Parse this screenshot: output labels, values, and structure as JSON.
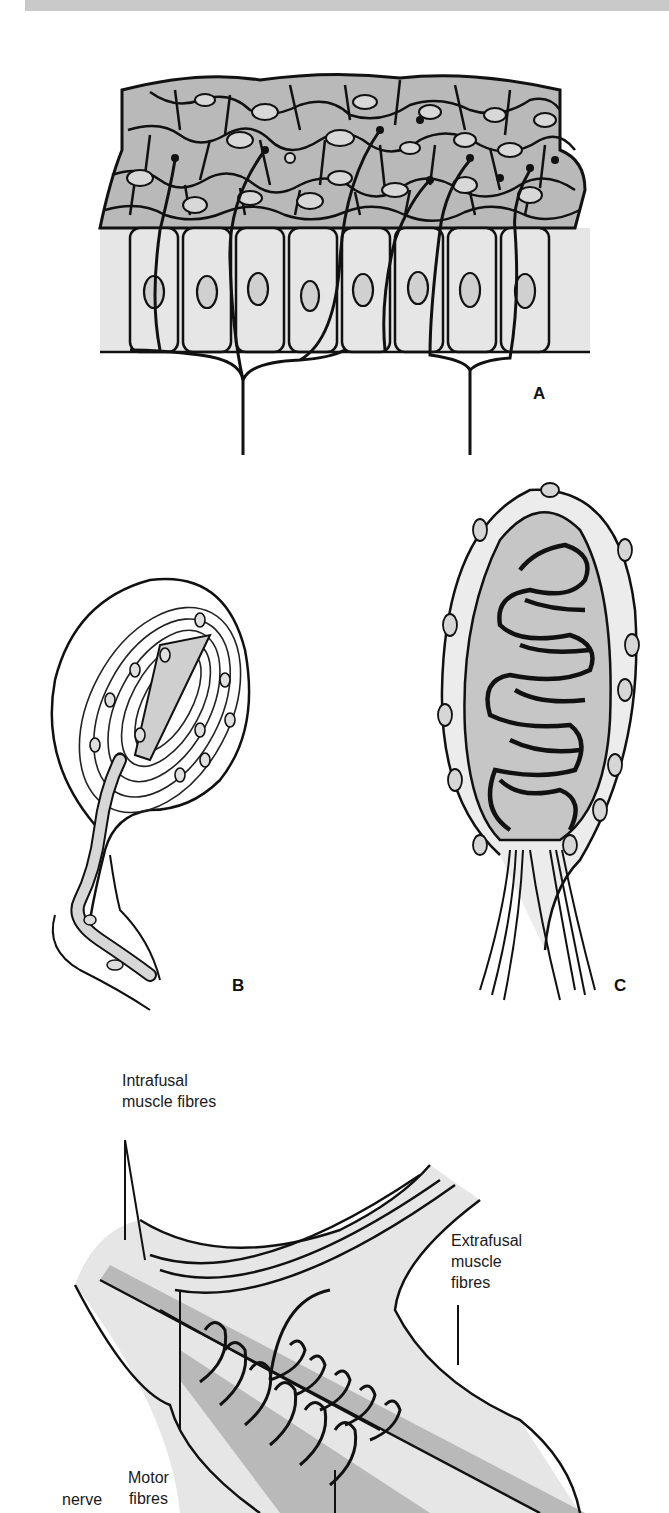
{
  "page": {
    "type": "textbook figure page"
  },
  "colors": {
    "top_band": "#c9c9c9",
    "dark_fill": "#b9b9b9",
    "light_fill": "#e6e6e6",
    "ink": "#111111",
    "background": "#ffffff"
  },
  "figures": {
    "a": {
      "label": "A",
      "caption_hint": "free nerve endings in epithelium"
    },
    "b": {
      "label": "B",
      "caption_hint": "lamellated corpuscle"
    },
    "c": {
      "label": "C",
      "caption_hint": "encapsulated corpuscle with coiled nerve"
    },
    "d": {
      "annotations": {
        "intrafusal_line1": "Intrafusal",
        "intrafusal_line2": "muscle fibres",
        "extrafusal_line1": "Extrafusal",
        "extrafusal_line2": "muscle",
        "extrafusal_line3": "fibres",
        "motor_line1": "Motor",
        "motor_line2": "fibres",
        "nerve": "nerve"
      }
    }
  }
}
